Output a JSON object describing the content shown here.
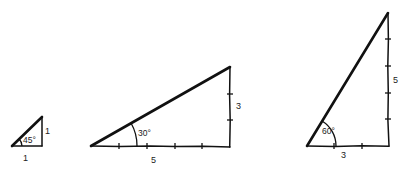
{
  "diagram": {
    "color": "#111111",
    "triangles": [
      {
        "name": "triangle-45",
        "angle_label": "45°",
        "vertical_leg_label": "1",
        "base_label": "1"
      },
      {
        "name": "triangle-30",
        "angle_label": "30°",
        "vertical_leg_label": "3",
        "base_label": "5",
        "base_ticks": 4,
        "vertical_ticks": 2
      },
      {
        "name": "triangle-60",
        "angle_label": "60°",
        "vertical_leg_label": "5",
        "base_label": "3",
        "base_ticks": 2,
        "vertical_ticks": 4
      }
    ]
  }
}
